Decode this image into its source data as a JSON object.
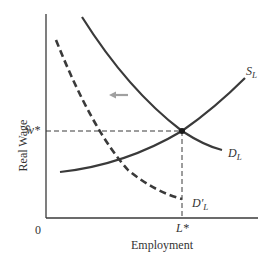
{
  "diagram": {
    "title": "",
    "y_axis_label": "Real Wage",
    "x_axis_label": "Employment",
    "origin_label": "0",
    "equilibrium_wage_label": "w*",
    "equilibrium_employment_label": "L*",
    "curves": [
      {
        "name": "S",
        "subscript": "L",
        "style": "solid",
        "meaning": "Labor supply"
      },
      {
        "name": "D",
        "subscript": "L",
        "style": "solid",
        "meaning": "Labor demand"
      },
      {
        "name": "D′",
        "subscript": "L",
        "style": "dashed",
        "meaning": "Shifted labor demand"
      }
    ],
    "shift_arrow": {
      "direction": "left",
      "color": "#a0a0a0"
    },
    "colors": {
      "curve": "#3a3a3a",
      "axis": "#3a3a3a",
      "guide": "#3a3a3a",
      "arrow": "#a0a0a0"
    }
  }
}
